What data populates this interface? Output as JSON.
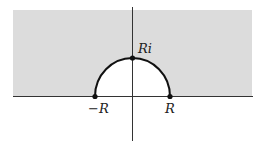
{
  "diagram": {
    "type": "complex-plane-contour",
    "colors": {
      "background": "#ffffff",
      "shaded_region": "#dcdcdc",
      "axis": "#333333",
      "contour": "#111111",
      "point": "#111111"
    },
    "labels": {
      "neg_r": "−R",
      "pos_r": "R",
      "ri": "Ri"
    },
    "points": [
      {
        "name": "neg_r",
        "label": "−R"
      },
      {
        "name": "pos_r",
        "label": "R"
      },
      {
        "name": "ri",
        "label": "Ri"
      }
    ]
  }
}
